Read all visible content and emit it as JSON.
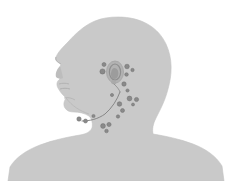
{
  "figure": {
    "title": "Head and neck lymph node anatomical illustration",
    "background_color": "#ffffff",
    "body_fill": "#c9c9c9",
    "body_stroke": "#bdbdbd",
    "node_fill": "#8a8a8a",
    "node_stroke": "#6f6f6f",
    "ear_fill": "#b0b0b0",
    "ear_inner_fill": "#9a9a9a",
    "chain_stroke": "#7a7a7a",
    "view": "left lateral profile",
    "canvas": {
      "width": 232,
      "height": 181
    }
  },
  "regions": {
    "head_label": "head",
    "face_label": "face-profile",
    "neck_label": "neck",
    "shoulders_label": "shoulders",
    "ear_label": "ear",
    "chain_label": "cervical-lymph-chain"
  },
  "lymph_nodes": [
    {
      "id": "preauricular-1",
      "cx": 102.5,
      "cy": 71.5,
      "r": 2.6
    },
    {
      "id": "preauricular-2",
      "cx": 104.0,
      "cy": 64.5,
      "r": 2.0
    },
    {
      "id": "postauricular-1",
      "cx": 127.0,
      "cy": 66.5,
      "r": 2.3
    },
    {
      "id": "postauricular-2",
      "cx": 132.5,
      "cy": 70.0,
      "r": 1.7
    },
    {
      "id": "postauricular-3",
      "cx": 126.5,
      "cy": 74.5,
      "r": 1.8
    },
    {
      "id": "occipital-1",
      "cx": 124.0,
      "cy": 84.0,
      "r": 2.2
    },
    {
      "id": "occipital-2",
      "cx": 127.5,
      "cy": 90.5,
      "r": 1.6
    },
    {
      "id": "posterior-cervical-1",
      "cx": 129.5,
      "cy": 98.5,
      "r": 2.4
    },
    {
      "id": "posterior-cervical-2",
      "cx": 136.5,
      "cy": 99.5,
      "r": 2.1
    },
    {
      "id": "posterior-cervical-3",
      "cx": 133.0,
      "cy": 104.5,
      "r": 1.5
    },
    {
      "id": "superficial-cervical-1",
      "cx": 119.5,
      "cy": 104.0,
      "r": 2.3
    },
    {
      "id": "superficial-cervical-2",
      "cx": 122.5,
      "cy": 110.5,
      "r": 2.0
    },
    {
      "id": "deep-cervical-1",
      "cx": 118.0,
      "cy": 116.5,
      "r": 1.7
    },
    {
      "id": "supraclavicular-1",
      "cx": 103.0,
      "cy": 126.0,
      "r": 2.4
    },
    {
      "id": "supraclavicular-2",
      "cx": 109.0,
      "cy": 124.5,
      "r": 2.1
    },
    {
      "id": "supraclavicular-3",
      "cx": 106.5,
      "cy": 131.0,
      "r": 1.8
    },
    {
      "id": "submandibular-1",
      "cx": 79.0,
      "cy": 119.0,
      "r": 2.2
    },
    {
      "id": "submandibular-2",
      "cx": 85.5,
      "cy": 121.0,
      "r": 2.0
    },
    {
      "id": "submental-1",
      "cx": 93.5,
      "cy": 116.0,
      "r": 1.6
    },
    {
      "id": "tonsillar-1",
      "cx": 112.0,
      "cy": 95.0,
      "r": 1.6
    }
  ]
}
